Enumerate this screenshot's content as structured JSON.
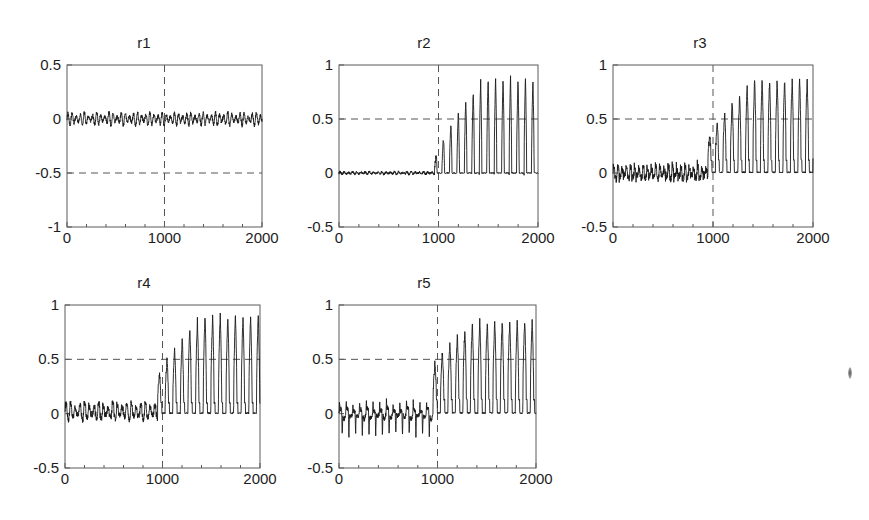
{
  "figure": {
    "background": "#ffffff",
    "trace_color": "#1a1a1a",
    "axis_color": "#5b5b5b",
    "grid_color": "#555555",
    "artifact_label": "scan-speck"
  },
  "chart_data": [
    {
      "type": "line",
      "title": "r1",
      "xlabel": "",
      "ylabel": "",
      "xlim": [
        0,
        2000
      ],
      "ylim": [
        -1,
        0.5
      ],
      "xticks": [
        0,
        1000,
        2000
      ],
      "xticklabels": [
        "0",
        "1000",
        "2000"
      ],
      "yticks": [
        -1,
        -0.5,
        0,
        0.5
      ],
      "yticklabels": [
        "-1",
        "-0.5",
        "0",
        "0.5"
      ],
      "grid": true,
      "gridlines": {
        "x": [
          1000
        ],
        "y": [
          -0.5
        ]
      },
      "legend": "none",
      "annotations": [],
      "description": "Dense small-amplitude oscillation centred on 0, unchanged across t=1000",
      "series": [
        {
          "name": "r1",
          "model": "oscillation",
          "baseline": 0.0,
          "segments": [
            {
              "x_start": 0,
              "x_end": 2000,
              "mean": 0.0,
              "amplitude": 0.055,
              "period": 42,
              "jitter": 0.018,
              "spike_up": 0.0,
              "spike_down": 0.0
            }
          ]
        }
      ]
    },
    {
      "type": "line",
      "title": "r2",
      "xlabel": "",
      "ylabel": "",
      "xlim": [
        0,
        2000
      ],
      "ylim": [
        -0.5,
        1
      ],
      "xticks": [
        0,
        1000,
        2000
      ],
      "xticklabels": [
        "0",
        "1000",
        "2000"
      ],
      "yticks": [
        -0.5,
        0,
        0.5,
        1
      ],
      "yticklabels": [
        "-0.5",
        "0",
        "0.5",
        "1"
      ],
      "grid": true,
      "gridlines": {
        "x": [
          1000
        ],
        "y": [
          0.5
        ]
      },
      "legend": "none",
      "annotations": [],
      "description": "Flat near zero until t=1000, then growing narrow pulses saturating near 0.85",
      "series": [
        {
          "name": "r2",
          "model": "pulse-train",
          "baseline": 0.0,
          "segments": [
            {
              "x_start": 0,
              "x_end": 960,
              "mean": 0.0,
              "amplitude": 0.012,
              "period": 42,
              "jitter": 0.01,
              "spike_up": 0.0,
              "spike_down": 0.0
            },
            {
              "x_start": 960,
              "x_end": 2000,
              "pulse_period": 75,
              "pulse_width": 0.34,
              "ramp_from": 0.12,
              "ramp_to": 0.88,
              "ramp_end_x": 1450,
              "floor": 0.0,
              "noise": 0.03
            }
          ]
        }
      ]
    },
    {
      "type": "line",
      "title": "r3",
      "xlabel": "",
      "ylabel": "",
      "xlim": [
        0,
        2000
      ],
      "ylim": [
        -0.5,
        1
      ],
      "xticks": [
        0,
        1000,
        2000
      ],
      "xticklabels": [
        "0",
        "1000",
        "2000"
      ],
      "yticks": [
        -0.5,
        0,
        0.5,
        1
      ],
      "yticklabels": [
        "-0.5",
        "0",
        "0.5",
        "1"
      ],
      "grid": true,
      "gridlines": {
        "x": [
          1000
        ],
        "y": [
          0.5
        ]
      },
      "legend": "none",
      "annotations": [],
      "description": "Small spiky activity about zero before t=1000, then growing narrow pulses to about 0.85",
      "series": [
        {
          "name": "r3",
          "model": "pulse-train",
          "baseline": 0.0,
          "segments": [
            {
              "x_start": 0,
              "x_end": 950,
              "mean": 0.0,
              "amplitude": 0.055,
              "period": 42,
              "jitter": 0.03,
              "spike_up": 0.07,
              "spike_down": -0.07
            },
            {
              "x_start": 950,
              "x_end": 2000,
              "pulse_period": 75,
              "pulse_width": 0.4,
              "ramp_from": 0.3,
              "ramp_to": 0.87,
              "ramp_end_x": 1420,
              "floor": 0.12,
              "noise": 0.04
            }
          ]
        }
      ]
    },
    {
      "type": "line",
      "title": "r4",
      "xlabel": "",
      "ylabel": "",
      "xlim": [
        0,
        2000
      ],
      "ylim": [
        -0.5,
        1
      ],
      "xticks": [
        0,
        1000,
        2000
      ],
      "xticklabels": [
        "0",
        "1000",
        "2000"
      ],
      "yticks": [
        -0.5,
        0,
        0.5,
        1
      ],
      "yticklabels": [
        "-0.5",
        "0",
        "0.5",
        "1"
      ],
      "grid": true,
      "gridlines": {
        "x": [
          1000
        ],
        "y": [
          0.5
        ]
      },
      "legend": "none",
      "annotations": [],
      "description": "Low-amplitude oscillation about zero then abrupt growth to narrow pulses near 0.9 after t=1000",
      "series": [
        {
          "name": "r4",
          "model": "pulse-train",
          "baseline": 0.0,
          "segments": [
            {
              "x_start": 0,
              "x_end": 950,
              "mean": 0.02,
              "amplitude": 0.075,
              "period": 48,
              "jitter": 0.025,
              "spike_up": 0.05,
              "spike_down": -0.05
            },
            {
              "x_start": 950,
              "x_end": 2000,
              "pulse_period": 78,
              "pulse_width": 0.42,
              "ramp_from": 0.32,
              "ramp_to": 0.9,
              "ramp_end_x": 1400,
              "floor": 0.1,
              "noise": 0.04
            }
          ]
        }
      ]
    },
    {
      "type": "line",
      "title": "r5",
      "xlabel": "",
      "ylabel": "",
      "xlim": [
        0,
        2000
      ],
      "ylim": [
        -0.5,
        1
      ],
      "xticks": [
        0,
        1000,
        2000
      ],
      "xticklabels": [
        "0",
        "1000",
        "2000"
      ],
      "yticks": [
        -0.5,
        0,
        0.5,
        1
      ],
      "yticklabels": [
        "-0.5",
        "0",
        "0.5",
        "1"
      ],
      "grid": true,
      "gridlines": {
        "x": [
          1000
        ],
        "y": [
          0.5
        ]
      },
      "legend": "none",
      "annotations": [],
      "description": "Downward spikes to about -0.2 before t=1000, then growing pulses saturating near 0.85",
      "series": [
        {
          "name": "r5",
          "model": "pulse-train",
          "baseline": 0.0,
          "segments": [
            {
              "x_start": 0,
              "x_end": 955,
              "mean": 0.0,
              "amplitude": 0.05,
              "period": 68,
              "jitter": 0.02,
              "spike_up": 0.1,
              "spike_down": -0.21
            },
            {
              "x_start": 955,
              "x_end": 2000,
              "pulse_period": 76,
              "pulse_width": 0.44,
              "ramp_from": 0.42,
              "ramp_to": 0.86,
              "ramp_end_x": 1380,
              "floor": 0.13,
              "noise": 0.04
            }
          ]
        }
      ]
    }
  ],
  "panels": [
    {
      "id": "r1",
      "left": 8,
      "top": 34,
      "width": 272,
      "height": 226,
      "plot_left": 59,
      "plot_top": 31,
      "plot_width": 195,
      "plot_height": 162
    },
    {
      "id": "r2",
      "left": 288,
      "top": 34,
      "width": 272,
      "height": 226,
      "plot_left": 51,
      "plot_top": 31,
      "plot_width": 199,
      "plot_height": 162
    },
    {
      "id": "r3",
      "left": 560,
      "top": 34,
      "width": 280,
      "height": 226,
      "plot_left": 53,
      "plot_top": 31,
      "plot_width": 200,
      "plot_height": 162
    },
    {
      "id": "r4",
      "left": 8,
      "top": 274,
      "width": 272,
      "height": 226,
      "plot_left": 57,
      "plot_top": 31,
      "plot_width": 195,
      "plot_height": 163
    },
    {
      "id": "r5",
      "left": 288,
      "top": 274,
      "width": 272,
      "height": 226,
      "plot_left": 51,
      "plot_top": 31,
      "plot_width": 197,
      "plot_height": 163
    }
  ],
  "artifact": {
    "left": 848,
    "top": 367
  }
}
